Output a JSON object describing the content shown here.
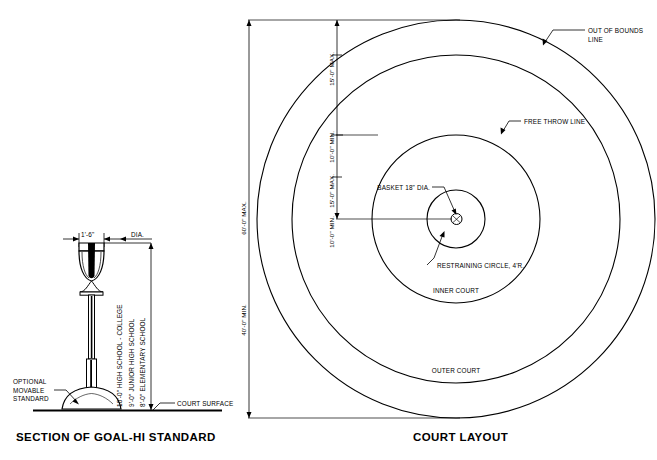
{
  "figure": {
    "title_left": "SECTION OF GOAL-HI STANDARD",
    "title_right": "COURT LAYOUT"
  },
  "goal_section": {
    "dim_width": "1'-6\"",
    "dim_width_note": "DIA.",
    "height_labels": [
      "10'-0\" HIGH SCHOOL - COLLEGE",
      "9'-0\" JUNIOR HIGH SCHOOL",
      "8'-0\" ELEMENTARY SCHOOL"
    ],
    "callouts": {
      "optional_standard_l1": "OPTIONAL",
      "optional_standard_l2": "MOVABLE",
      "optional_standard_l3": "STANDARD",
      "court_surface": "COURT SURFACE"
    }
  },
  "court_layout": {
    "overall_dims": [
      "60'-0\" MAX.",
      "40'-0\" MIN."
    ],
    "radial_dims": [
      "15'-0\" MAX.",
      "10'-0\" MIN.",
      "15'-0\" MAX.",
      "10'-0\" MIN."
    ],
    "callouts": {
      "out_of_bounds_l1": "OUT OF BOUNDS",
      "out_of_bounds_l2": "LINE",
      "free_throw_line": "FREE THROW LINE",
      "basket": "BASKET 18\" DIA.",
      "restraining_circle": "RESTRAINING CIRCLE, 4'R."
    },
    "zones": {
      "inner": "INNER COURT",
      "outer": "OUTER COURT"
    }
  },
  "colors": {
    "ink": "#000000",
    "paper": "#ffffff"
  }
}
